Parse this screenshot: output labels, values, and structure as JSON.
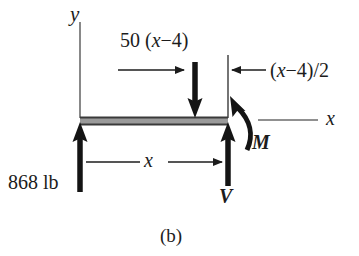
{
  "figure": {
    "caption": "(b)",
    "type": "free-body-diagram"
  },
  "axes": {
    "y_label": "y",
    "x_label": "x"
  },
  "loads": {
    "distributed_resultant_label": "50 (x−4)",
    "resultant_magnitude": 50,
    "resultant_direction": "down",
    "reaction_label": "868 lb",
    "reaction_magnitude": 868,
    "reaction_units": "lb",
    "reaction_direction": "up"
  },
  "internal_forces": {
    "shear_label": "V",
    "shear_direction": "up",
    "moment_label": "M",
    "moment_direction": "counterclockwise"
  },
  "dimensions": {
    "span_label": "x",
    "half_distance_label": "(x−4)/2"
  },
  "colors": {
    "ink": "#1c1c1c",
    "beam_fill": "#9a9a9a",
    "beam_edge": "#3a3a3a",
    "thin_line": "#555555",
    "background": "#ffffff"
  }
}
